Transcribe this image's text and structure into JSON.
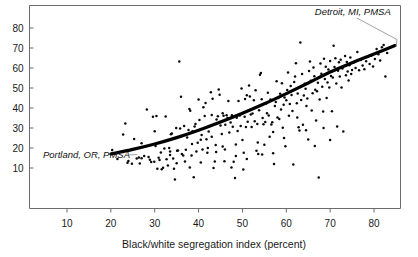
{
  "chart_data": {
    "type": "scatter",
    "title": "",
    "subtitle": "",
    "xlabel": "Black/white segregation index (percent)",
    "ylabel": "",
    "xlim": [
      3,
      88
    ],
    "ylim": [
      0,
      88
    ],
    "xticks": [
      10,
      20,
      30,
      40,
      50,
      60,
      70,
      80
    ],
    "xtick_labels": [
      "10",
      "20",
      "30",
      "40",
      "50",
      "60",
      "70",
      "80"
    ],
    "yticks": [
      10,
      20,
      30,
      40,
      50,
      60,
      70,
      80
    ],
    "ytick_labels": [
      "10",
      "20",
      "30",
      "40",
      "50",
      "60",
      "70",
      "80"
    ],
    "grid": false,
    "legend": null,
    "marker": "dot",
    "marker_color": "#0a0a0a",
    "trend_color": "#000000",
    "frame_color": "#6b6b6b",
    "annotations": [
      {
        "name": "detroit-annotation",
        "text": "Detroit, MI, PMSA",
        "label_x": 66.5,
        "label_y": 86.5,
        "point_x": 84.8,
        "point_y": 71.2
      },
      {
        "name": "portland-annotation",
        "text": "Portland, OR, PMSA",
        "label_x": 4.5,
        "label_y": 15.0,
        "point_x": 26.5,
        "point_y": 15.2
      }
    ],
    "trend_line": {
      "name": "fitted-curve",
      "points": [
        [
          20.0,
          17.0
        ],
        [
          25.0,
          19.3
        ],
        [
          30.0,
          22.0
        ],
        [
          35.0,
          25.2
        ],
        [
          40.0,
          28.9
        ],
        [
          45.0,
          33.0
        ],
        [
          50.0,
          37.4
        ],
        [
          55.0,
          42.1
        ],
        [
          60.0,
          47.2
        ],
        [
          65.0,
          52.5
        ],
        [
          70.0,
          58.0
        ],
        [
          75.0,
          62.6
        ],
        [
          80.0,
          67.0
        ],
        [
          84.8,
          71.2
        ]
      ]
    },
    "points": [
      [
        20.3,
        19.0
      ],
      [
        22.8,
        26.7
      ],
      [
        23.3,
        32.2
      ],
      [
        23.8,
        12.6
      ],
      [
        24.8,
        12.1
      ],
      [
        25.3,
        24.5
      ],
      [
        25.9,
        14.8
      ],
      [
        26.4,
        15.2
      ],
      [
        26.6,
        12.2
      ],
      [
        27.0,
        14.9
      ],
      [
        27.6,
        16.0
      ],
      [
        28.2,
        39.2
      ],
      [
        28.6,
        15.5
      ],
      [
        28.9,
        14.1
      ],
      [
        29.2,
        13.0
      ],
      [
        29.6,
        35.6
      ],
      [
        29.9,
        13.1
      ],
      [
        30.2,
        21.0
      ],
      [
        30.4,
        36.0
      ],
      [
        30.6,
        9.6
      ],
      [
        30.9,
        15.1
      ],
      [
        31.1,
        14.0
      ],
      [
        31.4,
        17.8
      ],
      [
        31.6,
        9.4
      ],
      [
        31.9,
        10.1
      ],
      [
        32.2,
        19.7
      ],
      [
        32.5,
        35.8
      ],
      [
        32.7,
        14.4
      ],
      [
        33.0,
        11.2
      ],
      [
        33.3,
        20.0
      ],
      [
        33.5,
        18.3
      ],
      [
        33.7,
        26.9
      ],
      [
        33.9,
        27.2
      ],
      [
        34.2,
        14.8
      ],
      [
        34.4,
        9.6
      ],
      [
        34.6,
        4.2
      ],
      [
        34.9,
        30.0
      ],
      [
        35.1,
        18.6
      ],
      [
        35.3,
        18.8
      ],
      [
        35.6,
        63.2
      ],
      [
        35.8,
        29.8
      ],
      [
        36.0,
        45.6
      ],
      [
        36.2,
        17.0
      ],
      [
        36.5,
        16.2
      ],
      [
        36.7,
        31.0
      ],
      [
        36.9,
        13.3
      ],
      [
        37.1,
        19.1
      ],
      [
        37.4,
        25.3
      ],
      [
        37.7,
        29.0
      ],
      [
        37.9,
        39.5
      ],
      [
        38.1,
        38.6
      ],
      [
        38.4,
        16.2
      ],
      [
        38.6,
        28.4
      ],
      [
        38.9,
        5.4
      ],
      [
        39.1,
        30.7
      ],
      [
        39.3,
        32.0
      ],
      [
        39.5,
        18.3
      ],
      [
        39.8,
        22.6
      ],
      [
        40.0,
        44.2
      ],
      [
        40.2,
        34.0
      ],
      [
        40.5,
        24.1
      ],
      [
        40.7,
        26.5
      ],
      [
        40.9,
        19.3
      ],
      [
        41.1,
        40.4
      ],
      [
        41.4,
        36.0
      ],
      [
        41.6,
        42.5
      ],
      [
        41.8,
        24.4
      ],
      [
        42.1,
        20.0
      ],
      [
        42.3,
        28.2
      ],
      [
        42.5,
        30.9
      ],
      [
        42.8,
        47.9
      ],
      [
        43.0,
        36.5
      ],
      [
        43.2,
        44.6
      ],
      [
        43.4,
        10.0
      ],
      [
        43.7,
        13.2
      ],
      [
        43.9,
        21.5
      ],
      [
        44.1,
        34.3
      ],
      [
        44.4,
        35.9
      ],
      [
        44.6,
        49.3
      ],
      [
        44.8,
        46.6
      ],
      [
        45.0,
        31.2
      ],
      [
        45.3,
        27.0
      ],
      [
        45.5,
        37.4
      ],
      [
        45.7,
        36.1
      ],
      [
        45.9,
        13.4
      ],
      [
        46.1,
        31.6
      ],
      [
        46.4,
        36.4
      ],
      [
        46.6,
        35.0
      ],
      [
        46.8,
        43.5
      ],
      [
        47.0,
        27.8
      ],
      [
        47.3,
        32.8
      ],
      [
        47.5,
        10.3
      ],
      [
        47.6,
        36.4
      ],
      [
        47.8,
        30.6
      ],
      [
        48.0,
        13.1
      ],
      [
        48.3,
        5.0
      ],
      [
        48.5,
        21.7
      ],
      [
        48.7,
        35.1
      ],
      [
        48.9,
        28.5
      ],
      [
        49.1,
        43.5
      ],
      [
        49.4,
        36.2
      ],
      [
        49.6,
        31.0
      ],
      [
        49.8,
        49.7
      ],
      [
        50.0,
        24.0
      ],
      [
        50.2,
        9.3
      ],
      [
        50.5,
        35.6
      ],
      [
        50.6,
        44.5
      ],
      [
        50.8,
        30.5
      ],
      [
        51.0,
        46.4
      ],
      [
        51.2,
        33.1
      ],
      [
        51.5,
        51.3
      ],
      [
        51.7,
        45.8
      ],
      [
        51.9,
        36.8
      ],
      [
        52.1,
        30.5
      ],
      [
        52.3,
        37.3
      ],
      [
        52.6,
        43.9
      ],
      [
        52.8,
        33.4
      ],
      [
        53.0,
        48.9
      ],
      [
        53.2,
        18.6
      ],
      [
        53.4,
        32.0
      ],
      [
        53.6,
        17.0
      ],
      [
        53.8,
        38.9
      ],
      [
        54.0,
        56.6
      ],
      [
        54.2,
        57.5
      ],
      [
        54.4,
        44.4
      ],
      [
        54.6,
        35.0
      ],
      [
        54.8,
        31.9
      ],
      [
        55.0,
        21.6
      ],
      [
        55.2,
        33.0
      ],
      [
        55.4,
        42.2
      ],
      [
        55.6,
        37.4
      ],
      [
        55.8,
        47.6
      ],
      [
        56.0,
        36.3
      ],
      [
        56.2,
        25.6
      ],
      [
        56.4,
        44.3
      ],
      [
        56.6,
        31.8
      ],
      [
        56.8,
        32.9
      ],
      [
        57.0,
        17.4
      ],
      [
        57.2,
        12.0
      ],
      [
        57.4,
        41.0
      ],
      [
        57.6,
        43.0
      ],
      [
        57.8,
        53.4
      ],
      [
        58.0,
        35.3
      ],
      [
        58.2,
        45.0
      ],
      [
        58.4,
        34.5
      ],
      [
        58.6,
        47.1
      ],
      [
        58.8,
        39.2
      ],
      [
        59.0,
        52.4
      ],
      [
        59.2,
        30.1
      ],
      [
        59.4,
        41.6
      ],
      [
        59.6,
        45.3
      ],
      [
        59.8,
        20.9
      ],
      [
        60.0,
        43.9
      ],
      [
        60.2,
        49.0
      ],
      [
        60.4,
        57.8
      ],
      [
        60.6,
        36.1
      ],
      [
        60.8,
        42.0
      ],
      [
        61.0,
        51.0
      ],
      [
        61.2,
        46.5
      ],
      [
        61.4,
        38.5
      ],
      [
        61.6,
        11.7
      ],
      [
        61.8,
        53.0
      ],
      [
        62.0,
        55.7
      ],
      [
        62.2,
        62.4
      ],
      [
        62.4,
        42.4
      ],
      [
        62.6,
        47.3
      ],
      [
        62.8,
        30.4
      ],
      [
        63.0,
        28.7
      ],
      [
        63.2,
        72.7
      ],
      [
        63.4,
        44.0
      ],
      [
        63.6,
        57.0
      ],
      [
        63.8,
        31.6
      ],
      [
        64.0,
        46.2
      ],
      [
        64.2,
        52.1
      ],
      [
        64.4,
        49.6
      ],
      [
        64.6,
        41.0
      ],
      [
        64.8,
        44.7
      ],
      [
        65.0,
        24.3
      ],
      [
        65.2,
        58.5
      ],
      [
        65.4,
        63.2
      ],
      [
        65.6,
        53.6
      ],
      [
        65.8,
        38.8
      ],
      [
        66.0,
        47.4
      ],
      [
        66.2,
        60.3
      ],
      [
        66.4,
        55.9
      ],
      [
        66.6,
        49.1
      ],
      [
        66.8,
        33.8
      ],
      [
        67.0,
        48.4
      ],
      [
        67.2,
        52.6
      ],
      [
        67.4,
        5.3
      ],
      [
        67.6,
        44.2
      ],
      [
        67.8,
        62.3
      ],
      [
        68.0,
        57.1
      ],
      [
        68.2,
        50.6
      ],
      [
        68.4,
        38.3
      ],
      [
        68.6,
        64.6
      ],
      [
        68.8,
        54.5
      ],
      [
        69.0,
        60.6
      ],
      [
        69.2,
        45.0
      ],
      [
        69.4,
        52.8
      ],
      [
        69.6,
        59.2
      ],
      [
        69.8,
        50.3
      ],
      [
        70.0,
        63.5
      ],
      [
        70.2,
        56.0
      ],
      [
        70.4,
        38.4
      ],
      [
        70.6,
        55.3
      ],
      [
        70.8,
        71.1
      ],
      [
        71.0,
        60.5
      ],
      [
        71.2,
        64.9
      ],
      [
        71.4,
        52.3
      ],
      [
        71.6,
        30.7
      ],
      [
        71.8,
        58.6
      ],
      [
        72.0,
        62.9
      ],
      [
        72.2,
        55.7
      ],
      [
        72.4,
        64.1
      ],
      [
        72.6,
        50.2
      ],
      [
        72.8,
        59.7
      ],
      [
        73.0,
        28.2
      ],
      [
        73.2,
        61.0
      ],
      [
        73.4,
        66.0
      ],
      [
        73.6,
        56.4
      ],
      [
        73.8,
        63.0
      ],
      [
        74.0,
        58.3
      ],
      [
        74.2,
        53.8
      ],
      [
        74.4,
        61.4
      ],
      [
        74.6,
        65.3
      ],
      [
        74.8,
        57.0
      ],
      [
        75.0,
        59.0
      ],
      [
        75.4,
        62.7
      ],
      [
        75.8,
        60.0
      ],
      [
        76.2,
        68.0
      ],
      [
        76.6,
        58.9
      ],
      [
        77.0,
        64.0
      ],
      [
        77.4,
        61.2
      ],
      [
        77.8,
        59.4
      ],
      [
        78.2,
        63.4
      ],
      [
        78.6,
        65.8
      ],
      [
        79.0,
        62.0
      ],
      [
        79.4,
        66.3
      ],
      [
        79.8,
        60.8
      ],
      [
        80.2,
        64.5
      ],
      [
        80.6,
        69.5
      ],
      [
        81.0,
        66.9
      ],
      [
        81.4,
        63.8
      ],
      [
        81.8,
        70.4
      ],
      [
        82.2,
        71.5
      ],
      [
        82.6,
        55.8
      ],
      [
        83.0,
        67.5
      ],
      [
        21.5,
        14.5
      ],
      [
        24.0,
        13.5
      ],
      [
        35.0,
        12.4
      ],
      [
        38.0,
        10.2
      ],
      [
        42.0,
        17.6
      ],
      [
        46.0,
        19.2
      ],
      [
        50.3,
        17.6
      ],
      [
        53.5,
        22.7
      ],
      [
        54.5,
        16.8
      ],
      [
        57.0,
        28.0
      ],
      [
        59.5,
        25.0
      ],
      [
        62.5,
        35.2
      ],
      [
        64.5,
        28.9
      ],
      [
        66.5,
        21.0
      ],
      [
        68.5,
        30.0
      ],
      [
        70.0,
        24.0
      ],
      [
        45.5,
        20.8
      ],
      [
        48.5,
        16.0
      ],
      [
        51.0,
        14.5
      ],
      [
        33.5,
        16.5
      ],
      [
        40.5,
        12.8
      ],
      [
        44.0,
        18.0
      ],
      [
        27.0,
        22.4
      ],
      [
        30.0,
        28.4
      ],
      [
        38.5,
        22.0
      ],
      [
        43.0,
        25.6
      ]
    ]
  },
  "axis": {
    "x_title": "Black/white segregation index (percent)"
  }
}
